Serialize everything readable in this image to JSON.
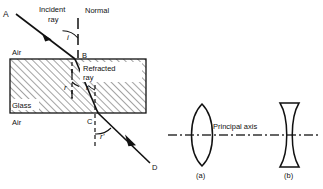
{
  "figure": {
    "background_color": "#ffffff",
    "line_color": "#111111",
    "hatch_color": "#555555"
  },
  "diagram_a_refraction": {
    "points": {
      "A": "A",
      "B": "B",
      "C": "C",
      "D": "D"
    },
    "labels": {
      "incident_ray": "Incident",
      "incident_ray_2": "ray",
      "normal": "Normal",
      "refracted_ray": "Refracted",
      "refracted_ray_2": "ray",
      "medium_air_top": "Air",
      "medium_glass": "Glass",
      "medium_air_bottom": "Air"
    },
    "angles": {
      "incidence": "i",
      "refraction_left": "r",
      "refraction_right": "r",
      "emergence": "r'"
    }
  },
  "diagram_b_lenses": {
    "axis_label": "Principal axis",
    "lenses": [
      {
        "caption": "(a)",
        "type": "biconvex"
      },
      {
        "caption": "(b)",
        "type": "biconcave"
      }
    ]
  }
}
